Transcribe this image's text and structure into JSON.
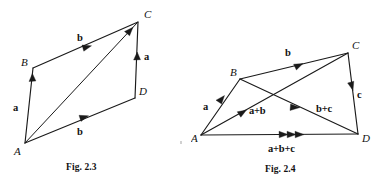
{
  "page": {
    "width": 382,
    "height": 184,
    "background": "#ffffff",
    "ink_color": "#1a1a1a"
  },
  "figures": [
    {
      "id": "fig-2-3",
      "caption": "Fig. 2.3",
      "description": "Parallelogram ABCD with vectors a and b and diagonal AC",
      "vertex_labels": {
        "A": "A",
        "B": "B",
        "C": "C",
        "D": "D"
      },
      "vector_labels": {
        "ab_side": "a",
        "bc_side": "b",
        "ad_side": "b",
        "dc_side": "a"
      },
      "vertices": {
        "A": [
          25,
          143
        ],
        "B": [
          33,
          68
        ],
        "C": [
          138,
          22
        ],
        "D": [
          135,
          98
        ]
      },
      "edges": [
        {
          "name": "A-to-B",
          "from": "A",
          "to": "B",
          "label": "a",
          "arrow": true
        },
        {
          "name": "B-to-C",
          "from": "B",
          "to": "C",
          "label": "b",
          "arrow": true
        },
        {
          "name": "A-to-D",
          "from": "A",
          "to": "D",
          "label": "b",
          "arrow": true
        },
        {
          "name": "D-to-C",
          "from": "D",
          "to": "C",
          "label": "a",
          "arrow": true
        },
        {
          "name": "A-to-C-diagonal",
          "from": "A",
          "to": "C",
          "label": "",
          "arrow": true
        }
      ]
    },
    {
      "id": "fig-2-4",
      "caption": "Fig. 2.4",
      "description": "Quadrilateral ABCD with vectors a, b, c and resultant sums a+b, b+c, a+b+c",
      "vertex_labels": {
        "A": "A",
        "B": "B",
        "C": "C",
        "D": "D"
      },
      "vector_labels": {
        "ab_side": "a",
        "bc_side": "b",
        "cd_side": "c",
        "ac_diagonal": "a+b",
        "bd_diagonal": "b+c",
        "ad_resultant": "a+b+c"
      },
      "vertices": {
        "A": [
          201,
          135
        ],
        "B": [
          240,
          79
        ],
        "C": [
          348,
          53
        ],
        "D": [
          358,
          134
        ]
      },
      "edges": [
        {
          "name": "A-to-B",
          "from": "A",
          "to": "B",
          "label": "a",
          "arrow": true
        },
        {
          "name": "B-to-C",
          "from": "B",
          "to": "C",
          "label": "b",
          "arrow": true
        },
        {
          "name": "C-to-D",
          "from": "C",
          "to": "D",
          "label": "c",
          "arrow": true
        },
        {
          "name": "A-to-C-diagonal",
          "from": "A",
          "to": "C",
          "label": "a+b",
          "arrow": true
        },
        {
          "name": "B-to-D-diagonal",
          "from": "B",
          "to": "D",
          "label": "b+c",
          "arrow": true
        },
        {
          "name": "A-to-D-resultant",
          "from": "A",
          "to": "D",
          "label": "a+b+c",
          "arrow": true
        }
      ]
    }
  ]
}
